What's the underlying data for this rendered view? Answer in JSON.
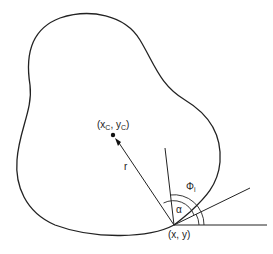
{
  "diagram": {
    "labels": {
      "center": "(x",
      "center_sub_x": "C",
      "center_mid": ", y",
      "center_sub_y": "C",
      "center_end": ")",
      "radius": "r",
      "point": "(x, y)",
      "alpha": "α",
      "phi": "Φ",
      "phi_sub": "i"
    },
    "colors": {
      "stroke": "#222222",
      "background": "#ffffff"
    }
  }
}
